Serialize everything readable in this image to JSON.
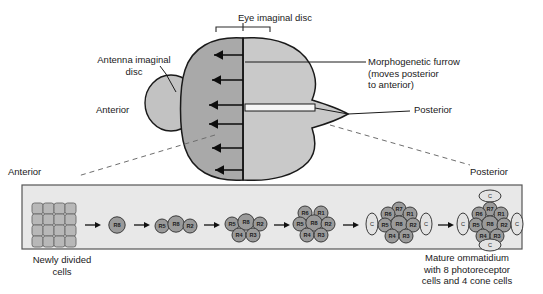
{
  "figure": {
    "topic": "Drosophila eye imaginal disc and ommatidium assembly",
    "colors": {
      "background": "#ffffff",
      "anterior_lobe_fill": "#a9a9a9",
      "posterior_lobe_fill": "#c9c9c9",
      "antenna_disc_fill": "#c2c2c2",
      "lower_panel_fill": "#e8e8e8",
      "lower_panel_stroke": "#555555",
      "photoreceptor_fill": "#9a9a9a",
      "cone_fill": "#e3e3e3",
      "grid_cell_fill": "#b8b8b8",
      "outline": "#1a1a1a",
      "dashed_guide": "#6e6e6e"
    }
  },
  "upper": {
    "eye_disc_title": "Eye imaginal disc",
    "antenna_label": "Antenna imaginal\ndisc",
    "anterior_label": "Anterior",
    "posterior_label": "Posterior",
    "furrow_label": "Morphogenetic furrow\n(moves posterior\nto anterior)",
    "furrow_arrow_count": 6,
    "furrow_direction": "posterior to anterior (leftward)"
  },
  "corners": {
    "anterior": "Anterior",
    "posterior": "Posterior"
  },
  "lower": {
    "caption_left": "Newly divided\ncells",
    "caption_right": "Mature ommatidium\nwith 8 photoreceptor\ncells and 4 cone cells",
    "grid_rows": 4,
    "grid_cols": 4,
    "stages": [
      {
        "index": 0,
        "name": "newly-divided-cells",
        "kind": "grid",
        "photoreceptors": [],
        "cone_cells": []
      },
      {
        "index": 1,
        "name": "stage-r8",
        "kind": "cluster",
        "photoreceptors": [
          "R8"
        ],
        "cone_cells": []
      },
      {
        "index": 2,
        "name": "stage-r5-r8-r2",
        "kind": "cluster",
        "photoreceptors": [
          "R5",
          "R8",
          "R2"
        ],
        "cone_cells": []
      },
      {
        "index": 3,
        "name": "stage-five-cell",
        "kind": "cluster",
        "photoreceptors": [
          "R5",
          "R8",
          "R2",
          "R4",
          "R3"
        ],
        "cone_cells": []
      },
      {
        "index": 4,
        "name": "stage-seven-cell",
        "kind": "cluster",
        "photoreceptors": [
          "R6",
          "R1",
          "R5",
          "R8",
          "R2",
          "R4",
          "R3"
        ],
        "cone_cells": []
      },
      {
        "index": 5,
        "name": "stage-eight-cell-two-cone",
        "kind": "cluster",
        "photoreceptors": [
          "R7",
          "R6",
          "R1",
          "R5",
          "R8",
          "R2",
          "R4",
          "R3"
        ],
        "cone_cells": [
          "C",
          "C"
        ]
      },
      {
        "index": 6,
        "name": "stage-mature-ommatidium",
        "kind": "cluster",
        "photoreceptors": [
          "R7",
          "R6",
          "R1",
          "R5",
          "R8",
          "R2",
          "R4",
          "R3"
        ],
        "cone_cells": [
          "C",
          "C",
          "C",
          "C"
        ]
      }
    ],
    "arrow_count": 6,
    "cell_labels": {
      "r1": "R1",
      "r2": "R2",
      "r3": "R3",
      "r4": "R4",
      "r5": "R5",
      "r6": "R6",
      "r7": "R7",
      "r8": "R8",
      "cone": "C"
    }
  }
}
